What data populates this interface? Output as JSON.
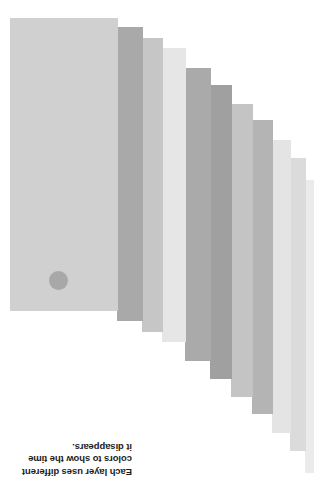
{
  "canvas": {
    "width": 314,
    "height": 484,
    "background": "#ffffff"
  },
  "caption": {
    "text": "Each layer uses different\ncolors to show the time\nit disappears.",
    "lines": [
      "Each layer uses different",
      "colors to show the time",
      "it disappears."
    ],
    "rotation_degrees": 180,
    "font_size_px": 9.5,
    "color": "#1d1d1d",
    "x": 12,
    "y": 436,
    "width": 120,
    "height": 42
  },
  "dot": {
    "name": "layer-marker-dot",
    "color": "#a8a8a8",
    "x": 49,
    "y": 271,
    "size": 19
  },
  "stack": {
    "label": "layer-stack",
    "count": 11,
    "layers": [
      {
        "index": 0,
        "label": "layer-1",
        "color": "#cfd0cf",
        "x": 10,
        "y": 18,
        "width": 108,
        "height": 293
      },
      {
        "index": 1,
        "label": "layer-2",
        "color": "#a8a9a8",
        "x": 117,
        "y": 27,
        "width": 26,
        "height": 294
      },
      {
        "index": 2,
        "label": "layer-3",
        "color": "#c5c6c5",
        "x": 142,
        "y": 38,
        "width": 21,
        "height": 294
      },
      {
        "index": 3,
        "label": "layer-4",
        "color": "#e5e6e5",
        "x": 162,
        "y": 48,
        "width": 24,
        "height": 294
      },
      {
        "index": 4,
        "label": "layer-5",
        "color": "#a9aaa9",
        "x": 185,
        "y": 68,
        "width": 26,
        "height": 293
      },
      {
        "index": 5,
        "label": "layer-6",
        "color": "#9fa09f",
        "x": 210,
        "y": 85,
        "width": 22,
        "height": 294
      },
      {
        "index": 6,
        "label": "layer-7",
        "color": "#c3c4c3",
        "x": 231,
        "y": 104,
        "width": 22,
        "height": 293
      },
      {
        "index": 7,
        "label": "layer-8",
        "color": "#b3b4b3",
        "x": 252,
        "y": 120,
        "width": 21,
        "height": 294
      },
      {
        "index": 8,
        "label": "layer-9",
        "color": "#e3e4e3",
        "x": 272,
        "y": 140,
        "width": 19,
        "height": 293
      },
      {
        "index": 9,
        "label": "layer-10",
        "color": "#dadbda",
        "x": 290,
        "y": 158,
        "width": 16,
        "height": 293
      },
      {
        "index": 10,
        "label": "layer-11",
        "color": "#eaebea",
        "x": 305,
        "y": 180,
        "width": 14,
        "height": 293
      }
    ]
  }
}
